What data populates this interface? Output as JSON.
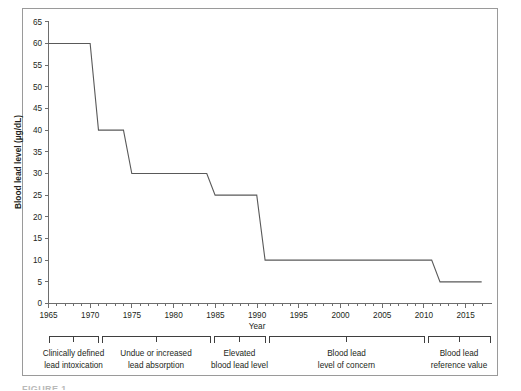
{
  "chart_data": {
    "type": "line",
    "title": "",
    "xlabel": "Year",
    "ylabel": "Blood lead level (µg/dL)",
    "xlim": [
      1965,
      2018
    ],
    "ylim": [
      0,
      65
    ],
    "ytick_step": 5,
    "xtick_step": 5,
    "xminor_tick_step": 1,
    "grid": false,
    "legend": false,
    "series": [
      {
        "name": "CDC blood lead level threshold",
        "color": "#595959",
        "x": [
          1965,
          1970,
          1971,
          1974,
          1975,
          1984,
          1985,
          1990,
          1991,
          2011,
          2012,
          2017
        ],
        "values": [
          60,
          60,
          40,
          40,
          30,
          30,
          25,
          25,
          10,
          10,
          5,
          5
        ]
      }
    ],
    "ytick_labels": [
      "0",
      "5",
      "10",
      "15",
      "20",
      "25",
      "30",
      "35",
      "40",
      "45",
      "50",
      "55",
      "60",
      "65"
    ],
    "xtick_labels": [
      "1965",
      "1970",
      "1975",
      "1980",
      "1985",
      "1990",
      "1995",
      "2000",
      "2005",
      "2010",
      "2015"
    ],
    "annotations": [
      {
        "label_line1": "Clinically defined",
        "label_line2": "lead intoxication",
        "x_start": 1965,
        "x_end": 1971
      },
      {
        "label_line1": "Undue or increased",
        "label_line2": "lead absorption",
        "x_start": 1971,
        "x_end": 1984.5
      },
      {
        "label_line1": "Elevated",
        "label_line2": "blood lead level",
        "x_start": 1984.5,
        "x_end": 1990.5
      },
      {
        "label_line1": "Blood lead",
        "label_line2": "level of concern",
        "x_start": 1990.5,
        "x_end": 2011.5
      },
      {
        "label_line1": "Blood lead",
        "label_line2": "reference value",
        "x_start": 2011.5,
        "x_end": 2018
      }
    ]
  },
  "figure": {
    "cutoff_caption": "FIGURE 1"
  }
}
